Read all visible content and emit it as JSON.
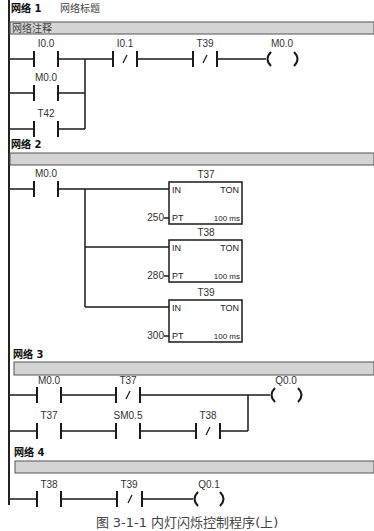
{
  "networks": [
    {
      "label": "网络 1",
      "title": "网络标题",
      "comment": "网络注释",
      "rungs": [
        {
          "elements": [
            {
              "type": "NO",
              "address": "I0.0"
            },
            {
              "type": "NC",
              "address": "I0.1"
            },
            {
              "type": "NC",
              "address": "T39"
            },
            {
              "type": "coil",
              "address": "M0.0"
            }
          ]
        },
        {
          "parallel_with": "I0.0",
          "elements": [
            {
              "type": "NO",
              "address": "M0.0"
            }
          ]
        },
        {
          "parallel_with": "I0.0",
          "elements": [
            {
              "type": "NO",
              "address": "T42"
            }
          ]
        }
      ]
    },
    {
      "label": "网络 2",
      "comment": "",
      "rungs": [
        {
          "elements": [
            {
              "type": "NO",
              "address": "M0.0"
            }
          ]
        }
      ],
      "timers": [
        {
          "name": "T37",
          "type": "TON",
          "in": "IN",
          "pt_label": "PT",
          "pt": "250",
          "base": "100 ms"
        },
        {
          "name": "T38",
          "type": "TON",
          "in": "IN",
          "pt_label": "PT",
          "pt": "280",
          "base": "100 ms"
        },
        {
          "name": "T39",
          "type": "TON",
          "in": "IN",
          "pt_label": "PT",
          "pt": "300",
          "base": "100 ms"
        }
      ]
    },
    {
      "label": "网络 3",
      "comment": "",
      "rungs": [
        {
          "elements": [
            {
              "type": "NO",
              "address": "M0.0"
            },
            {
              "type": "NC",
              "address": "T37"
            },
            {
              "type": "coil",
              "address": "Q0.0"
            }
          ]
        },
        {
          "elements": [
            {
              "type": "NO",
              "address": "T37"
            },
            {
              "type": "NO",
              "address": "SM0.5"
            },
            {
              "type": "NC",
              "address": "T38"
            }
          ]
        }
      ]
    },
    {
      "label": "网络 4",
      "comment": "",
      "rungs": [
        {
          "elements": [
            {
              "type": "NO",
              "address": "T38"
            },
            {
              "type": "NC",
              "address": "T39"
            },
            {
              "type": "coil",
              "address": "Q0.1"
            }
          ]
        }
      ]
    }
  ],
  "caption": "图 3-1-1 内灯闪烁控制程序(上)",
  "colors": {
    "line": "#1a1a1a",
    "bar_fill": "#d4d4d4",
    "bar_border": "#555555",
    "rail": "#222222"
  }
}
